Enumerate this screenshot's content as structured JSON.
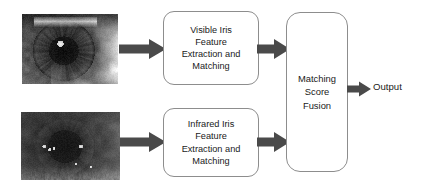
{
  "diagram": {
    "background_color": "#ffffff",
    "arrow_color": "#4a4a4a",
    "box_border_color": "#8d8d8d",
    "text_color": "#1a1a1a"
  },
  "inputs": [
    {
      "id": "visible-iris-image",
      "modality": "Visible",
      "description": "Grayscale close-up photograph of a human eye captured in visible light, high contrast bright sclera and dark pupil"
    },
    {
      "id": "infrared-iris-image",
      "modality": "Infrared",
      "description": "Grayscale close-up photograph of a human eye captured in infrared light, low contrast uniform gray iris with specular highlights"
    }
  ],
  "processes": [
    {
      "id": "visible-processing",
      "lines": [
        "Visible Iris",
        "Feature",
        "Extraction and",
        "Matching"
      ]
    },
    {
      "id": "infrared-processing",
      "lines": [
        "Infrared  Iris",
        "Feature",
        "Extraction and",
        "Matching"
      ]
    }
  ],
  "fusion": {
    "id": "matching-score-fusion",
    "lines": [
      "Matching",
      "Score",
      "Fusion"
    ]
  },
  "output": {
    "label": "Output"
  },
  "arrows": [
    {
      "id": "visible-image-to-visible-processing",
      "direction": "right"
    },
    {
      "id": "infrared-image-to-infrared-processing",
      "direction": "right"
    },
    {
      "id": "visible-processing-to-fusion",
      "direction": "right"
    },
    {
      "id": "infrared-processing-to-fusion",
      "direction": "right"
    },
    {
      "id": "fusion-to-output",
      "direction": "right"
    }
  ]
}
